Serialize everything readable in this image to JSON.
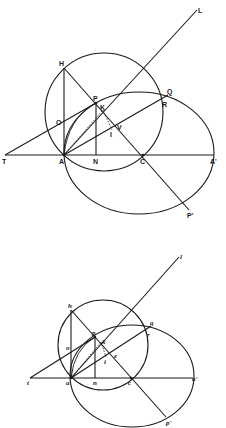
{
  "figures": [
    {
      "name": "upper-figure",
      "label_style": "uppercase",
      "labels": {
        "L": "L",
        "H": "H",
        "P": "P",
        "K": "K",
        "Q": "Q",
        "R": "R",
        "O": "O",
        "V": "V",
        "I": "I",
        "T": "T",
        "A": "A",
        "N": "N",
        "C": "C",
        "A_prime": "A'",
        "P_prime": "P'"
      }
    },
    {
      "name": "lower-figure",
      "label_style": "lowercase-italic",
      "labels": {
        "l": "l",
        "h": "h",
        "p": "p",
        "k": "k",
        "q": "q",
        "r": "r",
        "o": "o",
        "e": "e",
        "i": "i",
        "t": "t",
        "a": "a",
        "n": "n",
        "c": "c",
        "a_prime": "a'",
        "p_prime": "p'"
      }
    }
  ]
}
